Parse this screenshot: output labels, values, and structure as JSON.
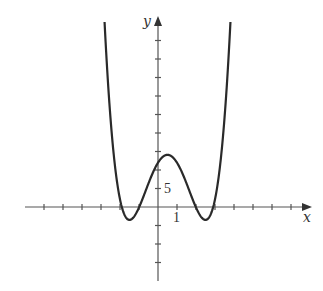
{
  "chart_data": {
    "type": "line",
    "title": "",
    "xlabel": "x",
    "ylabel": "y",
    "tick_labels": {
      "x": [
        "1"
      ],
      "y": [
        "5"
      ]
    },
    "x_tick_step": 1,
    "y_tick_step": 5,
    "xlim": [
      -7,
      8
    ],
    "ylim": [
      -20,
      45
    ],
    "grid": false,
    "legend": null,
    "series": [
      {
        "name": "f(x)",
        "description": "Quartic curve with two local minima near x≈-1.5 and x≈2.5 (y≈-3.5) and a local maximum near x≈0.5 (y≈14); rises steeply on both sides",
        "x": [
          -2.9,
          -2.5,
          -2,
          -1.5,
          -1,
          -0.5,
          0,
          0.5,
          1,
          1.5,
          2,
          2.5,
          3,
          3.5,
          3.9
        ],
        "y": [
          59.4,
          28.0,
          6.4,
          -3.5,
          0.0,
          5.4,
          11.2,
          14.1,
          11.2,
          5.4,
          0.0,
          -3.5,
          6.4,
          28.0,
          59.4
        ]
      }
    ],
    "annotations": []
  }
}
